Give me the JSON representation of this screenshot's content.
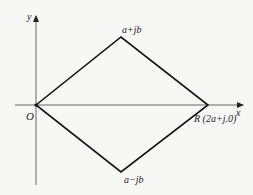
{
  "diagram": {
    "type": "complex-plane-rhombus",
    "axes": {
      "x_label": "x",
      "y_label": "y",
      "origin_label": "O"
    },
    "vertices": {
      "origin": {
        "label": "O",
        "px": [
          36,
          105
        ]
      },
      "top": {
        "label": "a+jb",
        "px": [
          121,
          37
        ]
      },
      "right": {
        "label": "R (2a+j.0)",
        "px": [
          208,
          105
        ]
      },
      "bottom": {
        "label": "a−jb",
        "px": [
          121,
          172
        ]
      }
    },
    "colors": {
      "line": "#111111",
      "axis": "#555555",
      "background": "#f7f7f5"
    }
  }
}
